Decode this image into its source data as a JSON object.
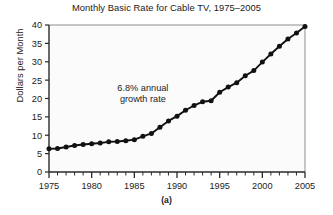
{
  "figure": {
    "caption": "(a)",
    "background_color": "#ffffff",
    "plot_background_color": "#fbfbfb"
  },
  "chart_data": {
    "type": "line",
    "title": "Monthly Basic Rate for Cable TV, 1975–2005",
    "xlabel": "",
    "ylabel": "Dollars per Month",
    "xlim": [
      1975,
      2005
    ],
    "ylim": [
      0,
      40
    ],
    "ytick_step": 5,
    "xtick_step": 5,
    "x_minor_tick_step": 1,
    "grid": false,
    "legend": "none",
    "marker": "filled-circle",
    "line_color": "#111111",
    "marker_color": "#111111",
    "yticks": [
      0,
      5,
      10,
      15,
      20,
      25,
      30,
      35,
      40
    ],
    "ytick_labels": [
      "0",
      "5",
      "10",
      "15",
      "20",
      "25",
      "30",
      "35",
      "40"
    ],
    "xticks": [
      1975,
      1980,
      1985,
      1990,
      1995,
      2000,
      2005
    ],
    "xtick_labels": [
      "1975",
      "1980",
      "1985",
      "1990",
      "1995",
      "2000",
      "2005"
    ],
    "x": [
      1975,
      1976,
      1977,
      1978,
      1979,
      1980,
      1981,
      1982,
      1983,
      1984,
      1985,
      1986,
      1987,
      1988,
      1989,
      1990,
      1991,
      1992,
      1993,
      1994,
      1995,
      1996,
      1997,
      1998,
      1999,
      2000,
      2001,
      2002,
      2003,
      2004,
      2005
    ],
    "values": [
      6.3,
      6.4,
      6.8,
      7.2,
      7.5,
      7.7,
      7.9,
      8.2,
      8.3,
      8.5,
      8.8,
      9.7,
      10.5,
      12.2,
      13.9,
      15.2,
      16.8,
      18.1,
      19.1,
      19.4,
      21.7,
      23.1,
      24.3,
      26.2,
      27.6,
      29.9,
      32.1,
      34.2,
      36.2,
      37.8,
      39.6
    ],
    "annotations": [
      {
        "text_line1": "6.8% annual",
        "text_line2": "growth rate",
        "x": 1986,
        "y": 22
      }
    ]
  }
}
